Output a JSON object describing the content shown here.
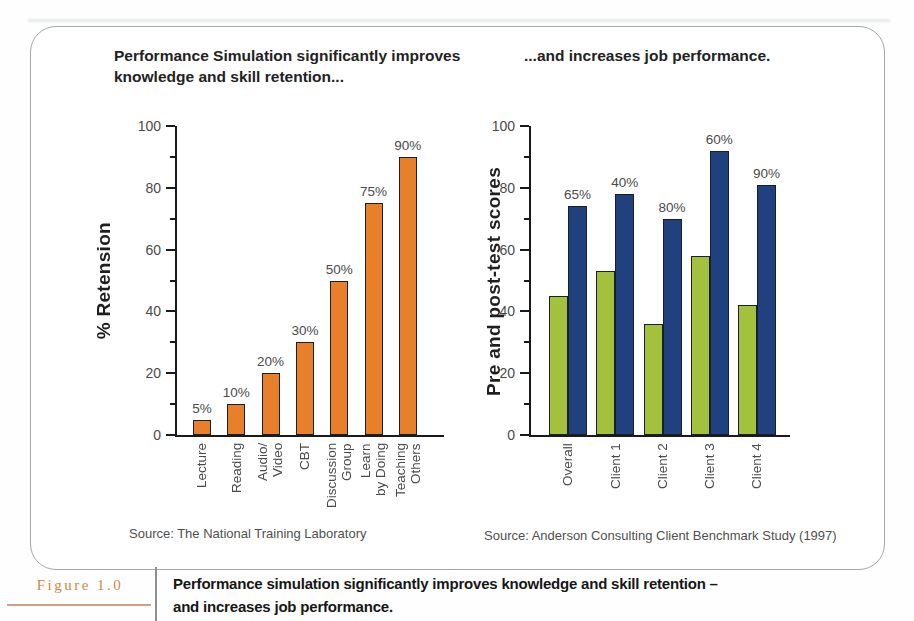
{
  "titles": {
    "left": "Performance Simulation significantly improves\nknowledge and skill retention...",
    "right": "...and increases job performance."
  },
  "figure_caption": {
    "label": "Figure 1.0",
    "text": "Performance simulation significantly improves knowledge and skill retention –\nand increases job performance."
  },
  "colors": {
    "retention_bar": "#e8802b",
    "pretest_bar": "#a3c13c",
    "posttest_bar": "#20407e",
    "axis": "#1a1a1a",
    "figure_label_accent": "#d0883f"
  },
  "chart_data": [
    {
      "type": "bar",
      "title": "Performance Simulation significantly improves knowledge and skill retention...",
      "ylabel": "% Retension",
      "xlabel": "",
      "categories": [
        "Lecture",
        "Reading",
        "Audio/\nVideo",
        "CBT",
        "Discussion\nGroup",
        "Learn\nby Doing",
        "Teaching\nOthers"
      ],
      "values": [
        5,
        10,
        20,
        30,
        50,
        75,
        90
      ],
      "bar_labels": [
        "5%",
        "10%",
        "20%",
        "30%",
        "50%",
        "75%",
        "90%"
      ],
      "ylim": [
        0,
        100
      ],
      "yticks": [
        0,
        20,
        40,
        60,
        80,
        100
      ],
      "minor_yticks": [
        10,
        30,
        50,
        70,
        90
      ],
      "grid": false,
      "legend": "none",
      "bar_color": "#e8802b",
      "source": "Source: The National Training Laboratory"
    },
    {
      "type": "bar",
      "title": "...and increases job performance.",
      "ylabel": "Pre and post-test scores",
      "xlabel": "",
      "categories": [
        "Overall",
        "Client 1",
        "Client 2",
        "Client 3",
        "Client 4"
      ],
      "series": [
        {
          "name": "pre-test",
          "color": "#a3c13c",
          "values": [
            45,
            53,
            36,
            58,
            42
          ]
        },
        {
          "name": "post-test",
          "color": "#20407e",
          "values": [
            74,
            78,
            70,
            92,
            81
          ]
        }
      ],
      "group_labels": [
        "65%",
        "40%",
        "80%",
        "60%",
        "90%"
      ],
      "ylim": [
        0,
        100
      ],
      "yticks": [
        0,
        20,
        40,
        60,
        80,
        100
      ],
      "minor_yticks": [
        10,
        30,
        50,
        70,
        90
      ],
      "grid": false,
      "legend": "none",
      "source": "Source: Anderson Consulting Client Benchmark Study (1997)"
    }
  ]
}
